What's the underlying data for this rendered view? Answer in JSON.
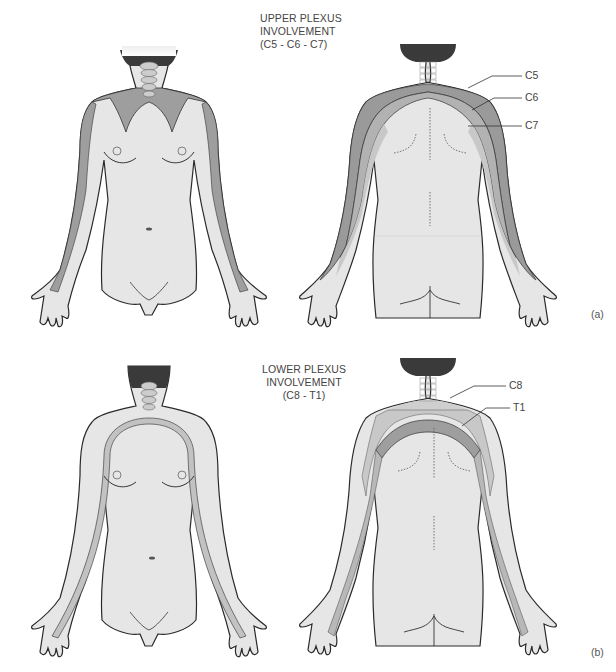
{
  "figure_a": {
    "title_lines": [
      "UPPER PLEXUS",
      "INVOLVEMENT",
      "(C5 - C6 - C7)"
    ],
    "labels": [
      "C5",
      "C6",
      "C7"
    ],
    "panel_tag": "(a)"
  },
  "figure_b": {
    "title_lines": [
      "LOWER PLEXUS",
      "INVOLVEMENT",
      "(C8 - T1)"
    ],
    "labels": [
      "C8",
      "T1"
    ],
    "panel_tag": "(b)"
  },
  "colors": {
    "skin": "#e6e6e6",
    "outline": "#2a2a2a",
    "dermatome_dark": "#9a9a9a",
    "dermatome_mid": "#b4b4b4",
    "dermatome_light": "#c8c8c8",
    "hair": "#3a3a3a",
    "text": "#444444"
  }
}
